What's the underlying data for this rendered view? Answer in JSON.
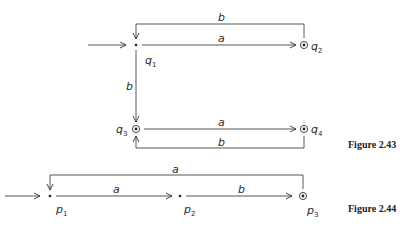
{
  "figures": [
    {
      "caption": "Figure 2.43",
      "states": [
        {
          "name": "q",
          "sub": "1",
          "initial": true,
          "accepting": false
        },
        {
          "name": "q",
          "sub": "2",
          "initial": false,
          "accepting": true
        },
        {
          "name": "q",
          "sub": "3",
          "initial": false,
          "accepting": true
        },
        {
          "name": "q",
          "sub": "4",
          "initial": false,
          "accepting": true
        }
      ],
      "transitions": [
        {
          "from": "q1",
          "to": "q2",
          "label": "a"
        },
        {
          "from": "q2",
          "to": "q1",
          "label": "b"
        },
        {
          "from": "q1",
          "to": "q3",
          "label": "b"
        },
        {
          "from": "q3",
          "to": "q4",
          "label": "a"
        },
        {
          "from": "q4",
          "to": "q3",
          "label": "b"
        }
      ]
    },
    {
      "caption": "Figure 2.44",
      "states": [
        {
          "name": "p",
          "sub": "1",
          "initial": true,
          "accepting": false
        },
        {
          "name": "p",
          "sub": "2",
          "initial": false,
          "accepting": false
        },
        {
          "name": "p",
          "sub": "3",
          "initial": false,
          "accepting": true
        }
      ],
      "transitions": [
        {
          "from": "p1",
          "to": "p2",
          "label": "a"
        },
        {
          "from": "p2",
          "to": "p3",
          "label": "b"
        },
        {
          "from": "p3",
          "to": "p1",
          "label": "a"
        }
      ]
    }
  ]
}
